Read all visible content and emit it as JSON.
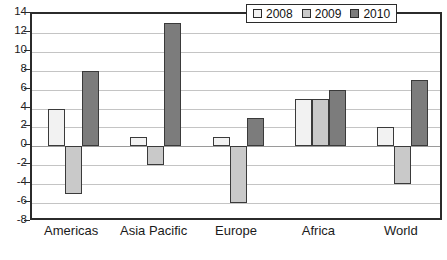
{
  "chart_data": {
    "type": "bar",
    "title": "",
    "xlabel": "",
    "ylabel": "",
    "categories": [
      "Americas",
      "Asia Pacific",
      "Europe",
      "Africa",
      "World"
    ],
    "series": [
      {
        "name": "2008",
        "color": "#f2f2f2",
        "values": [
          4,
          1,
          1,
          5,
          2
        ]
      },
      {
        "name": "2009",
        "color": "#c9c9c9",
        "values": [
          -5,
          -2,
          -6,
          5,
          -4
        ]
      },
      {
        "name": "2010",
        "color": "#7c7c7c",
        "values": [
          8,
          13,
          3,
          6,
          7
        ]
      }
    ],
    "ylim": [
      -8,
      14
    ],
    "ytick_step": 2,
    "yticks": [
      14,
      12,
      10,
      8,
      6,
      4,
      2,
      0,
      -2,
      -4,
      -6,
      -8
    ],
    "grid": true,
    "legend_position": "top-center-right",
    "zero_line": 0
  },
  "legend": {
    "entries": [
      {
        "label": "2008"
      },
      {
        "label": "2009"
      },
      {
        "label": "2010"
      }
    ]
  },
  "colors": {
    "series_2008": "#f2f2f2",
    "series_2009": "#c9c9c9",
    "series_2010": "#7c7c7c",
    "bar_outline": "#3a3a3a",
    "frame": "#2b2b2b",
    "gridline": "#c4c4c4",
    "text": "#1a1a1a"
  }
}
